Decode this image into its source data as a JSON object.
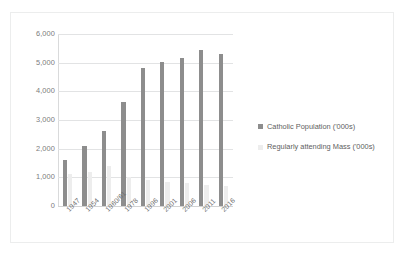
{
  "chart_data": {
    "type": "bar",
    "title": "",
    "xlabel": "",
    "ylabel": "",
    "ylim": [
      0,
      6000
    ],
    "yticks": [
      "0",
      "1,000",
      "2,000",
      "3,000",
      "4,000",
      "5,000",
      "6,000"
    ],
    "ytick_values": [
      0,
      1000,
      2000,
      3000,
      4000,
      5000,
      6000
    ],
    "grid": true,
    "legend_position": "right",
    "categories": [
      "1947",
      "1954",
      "1960/61",
      "1978",
      "1996",
      "2001",
      "2006",
      "2011",
      "2016"
    ],
    "series": [
      {
        "name": "Catholic Population ('000s)",
        "color": "#8d8d8d",
        "values": [
          1600,
          2100,
          2630,
          3620,
          4810,
          5020,
          5150,
          5450,
          5290
        ]
      },
      {
        "name": "Regularly attending Mass ('000s)",
        "color": "#ededed",
        "values": [
          1100,
          1200,
          1400,
          1000,
          900,
          850,
          820,
          750,
          700
        ]
      }
    ]
  },
  "legend": {
    "items": [
      {
        "label": "Catholic Population ('000s)",
        "swatch": "s1"
      },
      {
        "label": "Regularly attending Mass ('000s)",
        "swatch": "s2"
      }
    ]
  }
}
